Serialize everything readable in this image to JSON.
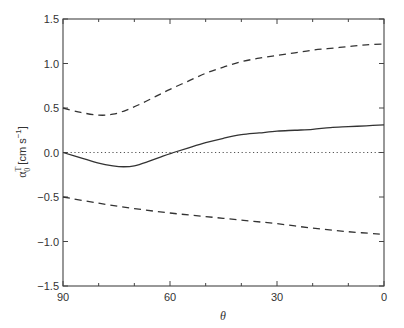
{
  "chart_data": {
    "type": "line",
    "title": "",
    "xlabel": "θ",
    "ylabel": "α0T [cm s−1]",
    "ylabel_parts": {
      "base": "α",
      "sub": "0",
      "sup": "T",
      "units": "[cm s",
      "units_sup": "−1",
      "units_close": "]"
    },
    "xlim": [
      90,
      0
    ],
    "ylim": [
      -1.5,
      1.5
    ],
    "x_reversed": true,
    "x_ticks": [
      90,
      60,
      30,
      0
    ],
    "x_tick_labels": [
      "90",
      "60",
      "30",
      "0"
    ],
    "x_minor_ticks": [
      80,
      70,
      50,
      40,
      20,
      10
    ],
    "y_ticks": [
      1.5,
      1.0,
      0.5,
      0.0,
      -0.5,
      -1.0,
      -1.5
    ],
    "y_tick_labels": [
      "1.5",
      "1.0",
      "0.5",
      "0.0",
      "−0.5",
      "−1.0",
      "−1.5"
    ],
    "grid": false,
    "legend": null,
    "reference_line": {
      "y": 0.0,
      "style": "dotted"
    },
    "series": [
      {
        "name": "mean",
        "style": "solid",
        "x": [
          90,
          85,
          80,
          76,
          73,
          70,
          66,
          62,
          59,
          55,
          50,
          45,
          40,
          35,
          30,
          25,
          20,
          15,
          10,
          5,
          0
        ],
        "y": [
          0.0,
          -0.06,
          -0.12,
          -0.15,
          -0.16,
          -0.15,
          -0.1,
          -0.04,
          0.0,
          0.05,
          0.11,
          0.16,
          0.2,
          0.22,
          0.24,
          0.25,
          0.26,
          0.28,
          0.29,
          0.3,
          0.31
        ]
      },
      {
        "name": "upper bound",
        "style": "dashed",
        "x": [
          90,
          85,
          80,
          76,
          72,
          68,
          64,
          60,
          55,
          50,
          45,
          40,
          35,
          30,
          25,
          20,
          15,
          10,
          5,
          0
        ],
        "y": [
          0.5,
          0.45,
          0.42,
          0.43,
          0.48,
          0.55,
          0.63,
          0.71,
          0.8,
          0.89,
          0.96,
          1.02,
          1.06,
          1.09,
          1.12,
          1.15,
          1.17,
          1.19,
          1.21,
          1.22
        ]
      },
      {
        "name": "lower bound",
        "style": "dashed",
        "x": [
          90,
          80,
          70,
          60,
          50,
          40,
          30,
          20,
          10,
          0
        ],
        "y": [
          -0.5,
          -0.57,
          -0.63,
          -0.68,
          -0.72,
          -0.76,
          -0.8,
          -0.85,
          -0.89,
          -0.92
        ]
      }
    ]
  }
}
